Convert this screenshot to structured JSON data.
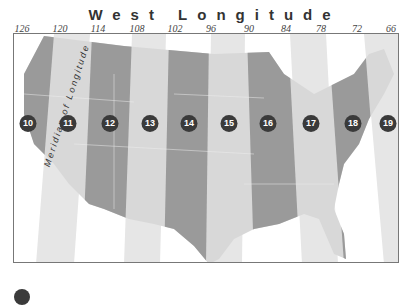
{
  "title": "West Longitude",
  "longitude_ticks": [
    {
      "label": "126",
      "x": 22
    },
    {
      "label": "120",
      "x": 60
    },
    {
      "label": "114",
      "x": 98
    },
    {
      "label": "108",
      "x": 137
    },
    {
      "label": "102",
      "x": 175
    },
    {
      "label": "96",
      "x": 211
    },
    {
      "label": "90",
      "x": 249
    },
    {
      "label": "84",
      "x": 286
    },
    {
      "label": "78",
      "x": 321
    },
    {
      "label": "72",
      "x": 357
    },
    {
      "label": "66",
      "x": 391
    }
  ],
  "meridian_label": "Meridian of Longitude",
  "zones": [
    {
      "label": "10",
      "x": 28
    },
    {
      "label": "11",
      "x": 68
    },
    {
      "label": "12",
      "x": 110
    },
    {
      "label": "13",
      "x": 150
    },
    {
      "label": "14",
      "x": 189
    },
    {
      "label": "15",
      "x": 229
    },
    {
      "label": "16",
      "x": 268
    },
    {
      "label": "17",
      "x": 311
    },
    {
      "label": "18",
      "x": 353
    },
    {
      "label": "19",
      "x": 388
    }
  ],
  "colors": {
    "dark_zone": "#9a9a9a",
    "light_zone": "#dcdcdc",
    "badge": "#3a3a3a"
  }
}
